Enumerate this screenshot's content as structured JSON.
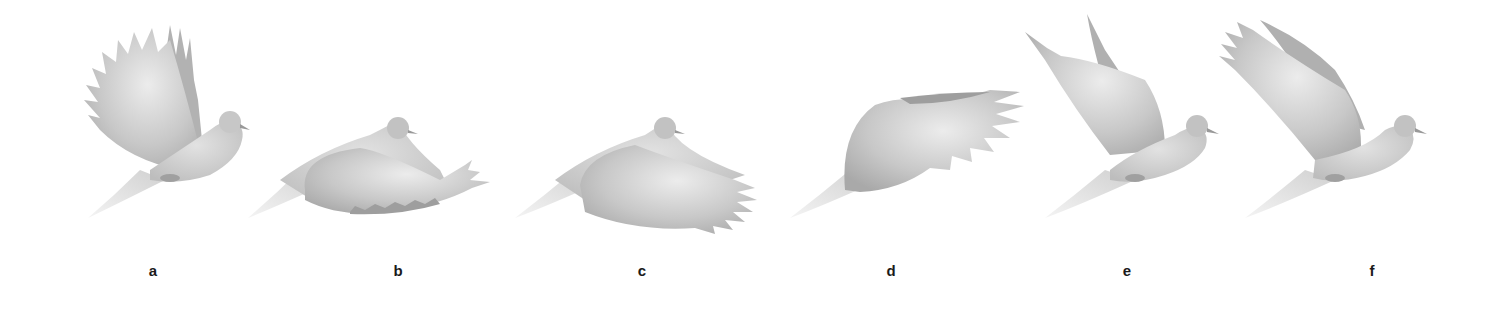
{
  "figure": {
    "panels": [
      {
        "id": "a",
        "label": "a",
        "pose": "wings raised fully up",
        "label_x": 153
      },
      {
        "id": "b",
        "label": "b",
        "pose": "wing sweeping down, tip feathers fanned back",
        "label_x": 398
      },
      {
        "id": "c",
        "label": "c",
        "pose": "wing at mid-downstroke, extended behind",
        "label_x": 642
      },
      {
        "id": "d",
        "label": "d",
        "pose": "wing at bottom of stroke, body hidden",
        "label_x": 891
      },
      {
        "id": "e",
        "label": "e",
        "pose": "wing rising, upstroke with tips raised",
        "label_x": 1127
      },
      {
        "id": "f",
        "label": "f",
        "pose": "wings raised high, extended back",
        "label_x": 1372
      }
    ],
    "colors": {
      "background": "#ffffff",
      "bird_light": "#e4e4e4",
      "bird_mid": "#c4c4c4",
      "bird_dark": "#a8a8a8",
      "label": "#1a1a1a"
    }
  }
}
